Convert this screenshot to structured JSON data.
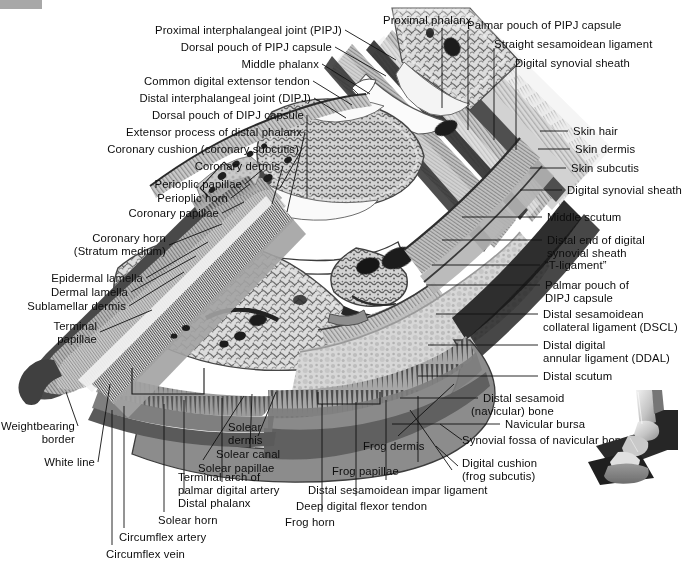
{
  "figure": {
    "kind": "anatomical-illustration",
    "modality": "grayscale-photographic-section",
    "background_color": "#ffffff",
    "text_color": "#0d0d0d",
    "corner_marker_color": "#a8a8a8"
  },
  "labels": {
    "top_left_block": [
      {
        "id": "pipj",
        "text": "Proximal interphalangeal joint (PIPJ)"
      },
      {
        "id": "dorsal-pipj",
        "text": "Dorsal pouch of PIPJ capsule"
      },
      {
        "id": "middle-phalanx",
        "text": "Middle phalanx"
      },
      {
        "id": "cdet",
        "text": "Common digital extensor tendon"
      },
      {
        "id": "dipj",
        "text": "Distal interphalangeal joint (DIPJ)"
      },
      {
        "id": "dorsal-dipj",
        "text": "Dorsal pouch of DIPJ capsule"
      },
      {
        "id": "extensor-process",
        "text": "Extensor process of distal phalanx"
      },
      {
        "id": "coronary-cushion",
        "text": "Coronary cushion (coronary subcutis)"
      },
      {
        "id": "coronary-dermis",
        "text": "Coronary dermis"
      },
      {
        "id": "perioplic-papillae",
        "text": "Perioplic papillae"
      },
      {
        "id": "perioplic-horn",
        "text": "Perioplic horn"
      },
      {
        "id": "coronary-papillae",
        "text": "Coronary papillae"
      }
    ],
    "left_block": [
      {
        "id": "coronary-horn",
        "line1": "Coronary horn",
        "line2": "(Stratum medium)"
      },
      {
        "id": "epidermal-lamella",
        "text": "Epidermal lamella"
      },
      {
        "id": "dermal-lamella",
        "text": "Dermal lamella"
      },
      {
        "id": "sublamellar-dermis",
        "text": "Sublamellar dermis"
      },
      {
        "id": "terminal-papillae",
        "line1": "Terminal",
        "line2": "papillae"
      },
      {
        "id": "weightbearing-border",
        "line1": "Weightbearing",
        "line2": "border"
      },
      {
        "id": "white-line",
        "text": "White line"
      }
    ],
    "bottom_block": [
      {
        "id": "circumflex-vein",
        "text": "Circumflex vein"
      },
      {
        "id": "circumflex-artery",
        "text": "Circumflex artery"
      },
      {
        "id": "solear-horn",
        "text": "Solear horn"
      },
      {
        "id": "distal-phalanx",
        "text": "Distal phalanx"
      },
      {
        "id": "terminal-arch",
        "line1": "Terminal arch of",
        "line2": "palmar digital artery"
      },
      {
        "id": "solear-papillae",
        "text": "Solear papillae"
      },
      {
        "id": "solear-canal",
        "text": "Solear canal"
      },
      {
        "id": "solear-dermis",
        "line1": "Solear",
        "line2": "dermis"
      },
      {
        "id": "frog-horn",
        "text": "Frog horn"
      },
      {
        "id": "ddft",
        "text": "Deep digital flexor tendon"
      },
      {
        "id": "dsil",
        "text": "Distal sesamoidean impar ligament"
      },
      {
        "id": "frog-papillae",
        "text": "Frog papillae"
      },
      {
        "id": "frog-dermis",
        "text": "Frog dermis"
      },
      {
        "id": "digital-cushion",
        "line1": "Digital cushion",
        "line2": "(frog subcutis)"
      }
    ],
    "top_right_block": [
      {
        "id": "proximal-phalanx",
        "text": "Proximal phalanx"
      },
      {
        "id": "palmar-pipj",
        "text": "Palmar pouch of PIPJ capsule"
      },
      {
        "id": "straight-sesamoidean",
        "text": "Straight sesamoidean ligament"
      },
      {
        "id": "digital-synovial-sheath-top",
        "text": "Digital synovial sheath"
      }
    ],
    "right_block": [
      {
        "id": "skin-hair",
        "text": "Skin hair"
      },
      {
        "id": "skin-dermis",
        "text": "Skin dermis"
      },
      {
        "id": "skin-subcutis",
        "text": "Skin subcutis"
      },
      {
        "id": "digital-synovial-sheath",
        "text": "Digital synovial sheath"
      },
      {
        "id": "middle-scutum",
        "text": "Middle scutum"
      },
      {
        "id": "distal-end-sheath",
        "line1": "Distal end of digital",
        "line2": "synovial sheath"
      },
      {
        "id": "t-ligament",
        "text": "“T-ligament”"
      },
      {
        "id": "palmar-dipj",
        "line1": "Palmar pouch of",
        "line2": "DIPJ capsule"
      },
      {
        "id": "dscl",
        "line1": "Distal sesamoidean",
        "line2": "collateral ligament (DSCL)"
      },
      {
        "id": "ddal",
        "line1": "Distal digital",
        "line2": "annular ligament (DDAL)"
      },
      {
        "id": "distal-scutum",
        "text": "Distal scutum"
      },
      {
        "id": "navicular-bone",
        "line1": "Distal sesamoid",
        "line2": "(navicular) bone"
      },
      {
        "id": "navicular-bursa",
        "text": "Navicular bursa"
      },
      {
        "id": "synovial-fossa",
        "text": "Synovial fossa of navicular bone"
      }
    ]
  },
  "inset": {
    "name": "orientation-photo",
    "description": "3D reconstruction of equine distal limb on a dark plinth",
    "background_color": "#2b2b2b"
  }
}
